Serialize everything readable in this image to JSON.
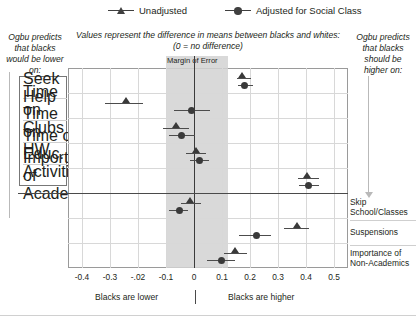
{
  "legend": {
    "items": [
      {
        "label": "Unadjusted",
        "marker": "triangle-icon",
        "color": "#404040"
      },
      {
        "label": "Adjusted for Social Class",
        "marker": "circle-icon",
        "color": "#404040"
      }
    ]
  },
  "captions": {
    "left": "Ogbu predicts that blacks would be lower on:",
    "center": "Values represent the difference in means between blacks and whites: (0 = no difference)",
    "right": "Ogbu predicts that blacks should be higher on:"
  },
  "annotations": {
    "margin_of_error": "Margin of Error",
    "footer_left": "Blacks are lower",
    "footer_right": "Blacks are higher"
  },
  "chart_data": {
    "type": "scatter",
    "title": "",
    "subtitle": "Values represent the difference in means between blacks and whites: (0 = no difference)",
    "xlabel": "",
    "ylabel": "",
    "xlim": [
      -0.45,
      0.55
    ],
    "xticks": [
      -0.4,
      -0.3,
      -0.2,
      -0.1,
      0,
      0.1,
      0.2,
      0.3,
      0.4,
      0.5
    ],
    "xticklabels": [
      "-0.4",
      "-0.3",
      "-.02",
      "-0.1",
      "0",
      "0.1",
      "0.2",
      "0.3",
      "0.4",
      "0.5"
    ],
    "grid": true,
    "legend_position": "top",
    "reference_line": 0,
    "margin_of_error_band": [
      -0.1,
      0.12
    ],
    "categories": [
      "Seek Help",
      "Time on Clubs",
      "Time on HW",
      "Time on Educ. Activities",
      "Importance of Academics",
      "Skip School/Classes",
      "Suspensions",
      "Importance of Non-Academics"
    ],
    "category_side": [
      "left",
      "left",
      "left",
      "left",
      "left",
      "right",
      "right",
      "right"
    ],
    "series": [
      {
        "name": "Unadjusted",
        "marker": "triangle",
        "points": [
          {
            "category": "Seek Help",
            "value": 0.173,
            "ci_low": 0.152,
            "ci_high": 0.203
          },
          {
            "category": "Time on Clubs",
            "value": -0.243,
            "ci_low": -0.318,
            "ci_high": -0.183
          },
          {
            "category": "Time on HW",
            "value": -0.063,
            "ci_low": -0.112,
            "ci_high": -0.018
          },
          {
            "category": "Time on Educ. Activities",
            "value": 0.007,
            "ci_low": -0.028,
            "ci_high": 0.044
          },
          {
            "category": "Importance of Academics",
            "value": 0.405,
            "ci_low": 0.373,
            "ci_high": 0.445
          },
          {
            "category": "Skip School/Classes",
            "value": -0.013,
            "ci_low": -0.047,
            "ci_high": 0.024
          },
          {
            "category": "Suspensions",
            "value": 0.368,
            "ci_low": 0.322,
            "ci_high": 0.412
          },
          {
            "category": "Importance of Non-Academics",
            "value": 0.146,
            "ci_low": 0.108,
            "ci_high": 0.191
          }
        ]
      },
      {
        "name": "Adjusted for Social Class",
        "marker": "circle",
        "points": [
          {
            "category": "Seek Help",
            "value": 0.18,
            "ci_low": 0.158,
            "ci_high": 0.212
          },
          {
            "category": "Time on Clubs",
            "value": -0.008,
            "ci_low": -0.073,
            "ci_high": 0.058
          },
          {
            "category": "Time on HW",
            "value": -0.043,
            "ci_low": -0.09,
            "ci_high": 0.003
          },
          {
            "category": "Time on Educ. Activities",
            "value": 0.018,
            "ci_low": -0.013,
            "ci_high": 0.052
          },
          {
            "category": "Importance of Academics",
            "value": 0.408,
            "ci_low": 0.374,
            "ci_high": 0.448
          },
          {
            "category": "Skip School/Classes",
            "value": -0.053,
            "ci_low": -0.088,
            "ci_high": -0.02
          },
          {
            "category": "Suspensions",
            "value": 0.222,
            "ci_low": 0.162,
            "ci_high": 0.276
          },
          {
            "category": "Importance of Non-Academics",
            "value": 0.098,
            "ci_low": 0.048,
            "ci_high": 0.148
          }
        ]
      }
    ]
  }
}
